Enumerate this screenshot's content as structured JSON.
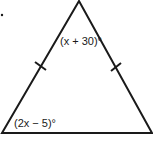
{
  "diagram": {
    "type": "isosceles-triangle",
    "stroke_color": "#1a1a1a",
    "background": "#ffffff",
    "vertices": {
      "apex": [
        79,
        1
      ],
      "bottom_left": [
        2,
        133
      ],
      "bottom_right": [
        152,
        133
      ]
    },
    "congruence_ticks": [
      "left-side",
      "right-side"
    ],
    "labels": {
      "apex_angle": "(x + 30)°",
      "base_left_angle": "(2x − 5)°"
    }
  }
}
